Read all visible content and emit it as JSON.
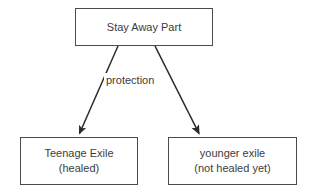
{
  "diagram": {
    "background_color": "#ffffff",
    "stroke_color": "#4a4a4a",
    "text_color": "#3c3c3c",
    "nodes": [
      {
        "id": "root",
        "lines": [
          "Stay Away Part"
        ],
        "line1": "Stay Away Part",
        "line2": ""
      },
      {
        "id": "left",
        "lines": [
          "Teenage Exile",
          "(healed)"
        ],
        "line1": "Teenage Exile",
        "line2": "(healed)"
      },
      {
        "id": "right",
        "lines": [
          "younger exile",
          "(not healed yet)"
        ],
        "line1": "younger exile",
        "line2": "(not healed yet)"
      }
    ],
    "edges": [
      {
        "id": "root-to-left",
        "from": "root",
        "to": "left",
        "label": "protection",
        "arrowhead": true
      },
      {
        "id": "root-to-right",
        "from": "root",
        "to": "right",
        "label": "",
        "arrowhead": true
      }
    ],
    "edge_label": "protection"
  }
}
